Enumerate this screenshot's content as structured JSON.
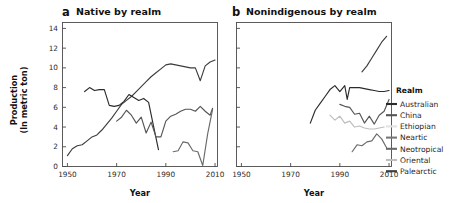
{
  "figure": {
    "width": 464,
    "height": 203,
    "background": "#ffffff"
  },
  "panels": [
    {
      "letter": "a",
      "title": "Native by realm",
      "xlabel": "Year",
      "ylabel_line1": "Production",
      "ylabel_line2": "(ln metric ton)"
    },
    {
      "letter": "b",
      "title": "Nonindigenous by realm",
      "xlabel": "Year",
      "ylabel_line1": "",
      "ylabel_line2": ""
    }
  ],
  "legend": {
    "title": "Realm",
    "items": [
      {
        "label": "Australian",
        "color": "#2b2b2b"
      },
      {
        "label": "China",
        "color": "#555555"
      },
      {
        "label": "Ethiopian",
        "color": "#e2e2e2"
      },
      {
        "label": "Neartic",
        "color": "#777777"
      },
      {
        "label": "Neotropical",
        "color": "#6a6a6a"
      },
      {
        "label": "Oriental",
        "color": "#bdbdbd"
      },
      {
        "label": "Palearctic",
        "color": "#3d3d3d"
      }
    ]
  },
  "chart_data": [
    {
      "id": "native-by-realm",
      "type": "line",
      "title": "Native by realm",
      "panel_letter": "a",
      "xlabel": "Year",
      "ylabel": "Production (ln metric ton)",
      "xlim": [
        1948,
        2011
      ],
      "ylim": [
        0,
        14.6
      ],
      "xticks": [
        1950,
        1970,
        1990,
        2010
      ],
      "yticks": [
        0,
        2,
        4,
        6,
        8,
        10,
        12,
        14
      ],
      "grid": false,
      "legend_position": "right-outside",
      "series": [
        {
          "name": "Palearctic",
          "color": "#3d3d3d",
          "x": [
            1950,
            1952,
            1954,
            1956,
            1958,
            1960,
            1962,
            1964,
            1966,
            1968,
            1970,
            1972,
            1974,
            1976,
            1978,
            1980,
            1982,
            1984,
            1986,
            1988,
            1990,
            1992,
            1994,
            1996,
            1998,
            2000,
            2002,
            2004,
            2006,
            2008,
            2010
          ],
          "y": [
            1.1,
            1.8,
            2.1,
            2.2,
            2.6,
            3.0,
            3.2,
            3.7,
            4.3,
            4.9,
            5.6,
            6.3,
            6.7,
            7.1,
            7.6,
            8.1,
            8.6,
            9.1,
            9.5,
            9.9,
            10.3,
            10.4,
            10.3,
            10.2,
            10.1,
            10.0,
            10.0,
            8.7,
            10.2,
            10.6,
            10.8
          ]
        },
        {
          "name": "Australian",
          "color": "#2b2b2b",
          "x": [
            1957,
            1959,
            1961,
            1963,
            1965,
            1967,
            1969,
            1971,
            1973,
            1975,
            1977,
            1979,
            1981,
            1983,
            1985,
            1987
          ],
          "y": [
            7.6,
            8.0,
            7.7,
            7.8,
            7.8,
            6.2,
            6.1,
            6.2,
            6.6,
            7.3,
            7.0,
            6.7,
            6.9,
            6.5,
            4.1,
            1.7
          ]
        },
        {
          "name": "China",
          "color": "#555555",
          "x": [
            1970,
            1972,
            1974,
            1976,
            1978,
            1980,
            1982,
            1984,
            1986,
            1988,
            1990,
            1992,
            1994,
            1996,
            1998,
            2000,
            2002,
            2004,
            2006,
            2008,
            2009
          ],
          "y": [
            4.6,
            5.0,
            5.7,
            5.2,
            4.4,
            5.0,
            3.4,
            4.5,
            3.0,
            3.0,
            4.6,
            5.1,
            5.3,
            5.6,
            5.8,
            5.8,
            5.6,
            6.1,
            5.6,
            5.2,
            5.9
          ]
        },
        {
          "name": "Neotropical",
          "color": "#6a6a6a",
          "x": [
            1993,
            1995,
            1997,
            1999,
            2001,
            2003,
            2005,
            2007,
            2009
          ],
          "y": [
            1.5,
            1.6,
            2.5,
            2.4,
            1.6,
            1.5,
            0.1,
            3.3,
            5.8
          ]
        }
      ]
    },
    {
      "id": "nonindigenous-by-realm",
      "type": "line",
      "title": "Nonindigenous by realm",
      "panel_letter": "b",
      "xlabel": "Year",
      "ylabel": "Production (ln metric ton)",
      "xlim": [
        1948,
        2011
      ],
      "ylim": [
        0,
        14.6
      ],
      "xticks": [
        1950,
        1970,
        1990,
        2010
      ],
      "yticks": [
        0,
        2,
        4,
        6,
        8,
        10,
        12,
        14
      ],
      "grid": false,
      "legend_position": "right-outside",
      "series": [
        {
          "name": "Palearctic",
          "color": "#3d3d3d",
          "x": [
            1999,
            2001,
            2003,
            2005,
            2007,
            2009
          ],
          "y": [
            9.6,
            10.2,
            11.0,
            11.8,
            12.6,
            13.2
          ]
        },
        {
          "name": "Australian",
          "color": "#2b2b2b",
          "x": [
            1978,
            1980,
            1982,
            1984,
            1986,
            1988,
            1990,
            1992,
            1993,
            1994,
            1996,
            1998,
            2000,
            2002,
            2004,
            2006,
            2008,
            2010
          ],
          "y": [
            4.4,
            5.7,
            6.4,
            7.1,
            7.8,
            8.2,
            7.6,
            8.2,
            6.8,
            8.0,
            8.0,
            8.0,
            7.9,
            7.8,
            7.7,
            7.6,
            7.6,
            7.7
          ]
        },
        {
          "name": "China",
          "color": "#555555",
          "x": [
            1990,
            1992,
            1994,
            1996,
            1998,
            2000,
            2002,
            2004,
            2006,
            2008,
            2010
          ],
          "y": [
            6.3,
            6.1,
            6.0,
            5.3,
            5.4,
            4.4,
            5.1,
            4.3,
            5.2,
            5.6,
            6.8
          ]
        },
        {
          "name": "Oriental",
          "color": "#bdbdbd",
          "x": [
            1986,
            1988,
            1990,
            1992,
            1994,
            1996,
            1998,
            2000,
            2002,
            2004,
            2006,
            2008
          ],
          "y": [
            5.2,
            4.7,
            5.1,
            4.4,
            4.6,
            4.0,
            4.1,
            3.9,
            3.8,
            3.8,
            3.9,
            4.0
          ]
        },
        {
          "name": "Neotropical",
          "color": "#6a6a6a",
          "x": [
            1995,
            1997,
            1999,
            2001,
            2003,
            2005,
            2007,
            2009
          ],
          "y": [
            1.5,
            2.2,
            2.1,
            2.5,
            2.6,
            3.3,
            2.8,
            1.9
          ]
        }
      ]
    }
  ]
}
